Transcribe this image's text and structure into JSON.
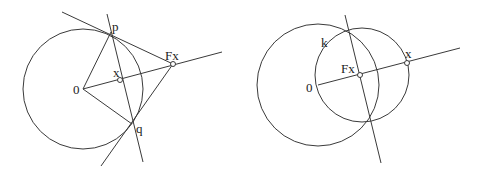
{
  "figures": [
    {
      "id": "left",
      "labels": {
        "p": "p",
        "Fx": "Fx",
        "x": "x",
        "O": "0",
        "q": "q"
      },
      "circle": {
        "cx": 83,
        "cy": 89,
        "r": 60
      },
      "points": {
        "O": [
          83,
          89
        ],
        "p": [
          111,
          32
        ],
        "q": [
          132,
          124
        ],
        "x": [
          120,
          80
        ],
        "Fx": [
          173,
          64
        ]
      }
    },
    {
      "id": "right",
      "labels": {
        "k": "k",
        "Fx": "Fx",
        "x": "x",
        "O": "0"
      },
      "circles": [
        {
          "cx": 318,
          "cy": 85,
          "r": 61
        },
        {
          "cx": 362,
          "cy": 75,
          "r": 47
        }
      ],
      "points": {
        "O": [
          318,
          85
        ],
        "Fx": [
          360,
          75
        ],
        "x": [
          407,
          63
        ]
      }
    }
  ]
}
